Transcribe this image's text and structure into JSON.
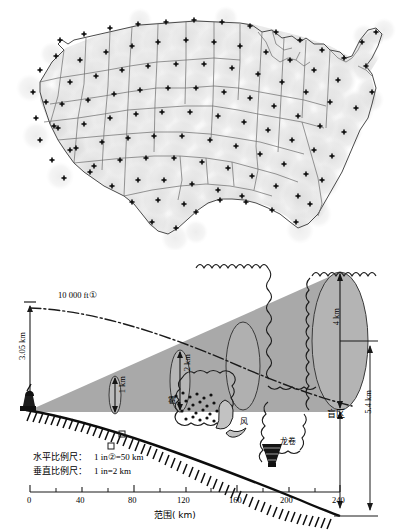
{
  "figure": {
    "panels": [
      {
        "id": "radar-coverage-map",
        "type": "map",
        "description_icons": [
          "radar-site-marker",
          "state-boundary",
          "coverage-circle"
        ]
      },
      {
        "id": "radar-beam-geometry",
        "type": "diagram"
      }
    ]
  },
  "map": {
    "region_label": "",
    "colors": {
      "coverage_fill": "#e8e8e8",
      "boundary": "#555555",
      "site_marker": "#111111"
    }
  },
  "chart_data": {
    "type": "line",
    "title": "",
    "xlabel": "范围( km)",
    "ylabel": "",
    "x": [
      0,
      40,
      80,
      120,
      160,
      200,
      240
    ],
    "xlim": [
      0,
      240
    ],
    "tick_labels": [
      "0",
      "40",
      "80",
      "120",
      "160",
      "200",
      "240"
    ],
    "grid": false,
    "legend_position": "none",
    "annotations": [
      {
        "name": "altitude-left",
        "text": "3.05 km",
        "value": 3.05,
        "unit": "km",
        "orientation": "vertical"
      },
      {
        "name": "beam-height-label",
        "text": "10 000 ft①",
        "value": 10000,
        "unit": "ft"
      },
      {
        "name": "beam-width-1",
        "text": "1 km",
        "value": 1,
        "unit": "km",
        "x_km": 60
      },
      {
        "name": "beam-width-2",
        "text": "2 km",
        "value": 2,
        "unit": "km",
        "x_km": 115
      },
      {
        "name": "beam-width-4",
        "text": "4 km",
        "value": 4,
        "unit": "km",
        "x_km": 230
      },
      {
        "name": "blind-zone-depth",
        "text": "5.4 km",
        "value": 5.4,
        "unit": "km"
      },
      {
        "name": "blind-zone",
        "text": "盲区"
      },
      {
        "name": "hail",
        "text": "雹"
      },
      {
        "name": "wind",
        "text": "风"
      },
      {
        "name": "tornado",
        "text": "龙卷"
      }
    ],
    "series": [
      {
        "name": "earth-curvature",
        "values": [
          0,
          -0.35,
          -1.1,
          -2.1,
          -3.3,
          -4.5,
          -5.4
        ]
      },
      {
        "name": "beam-axis-10000ft",
        "values": [
          3.05,
          3.0,
          2.7,
          2.2,
          1.6,
          0.9,
          0.1
        ]
      },
      {
        "name": "beam-upper-edge",
        "values": [
          0,
          0.9,
          1.9,
          3.0,
          4.1,
          5.2,
          6.3
        ]
      },
      {
        "name": "beam-lower-edge",
        "values": [
          0,
          0,
          0,
          0,
          0,
          0,
          0
        ]
      }
    ]
  },
  "scales": {
    "horizontal_label": "水平比例尺：",
    "horizontal_value": "1 in②=50 km",
    "vertical_label": "垂直比例尺：",
    "vertical_value": "1 in=2 km"
  },
  "colors": {
    "beam_fill": "#a9a9a9",
    "ground": "#0d0d0d",
    "ink": "#111111",
    "light_gray": "#c9c9c9"
  }
}
